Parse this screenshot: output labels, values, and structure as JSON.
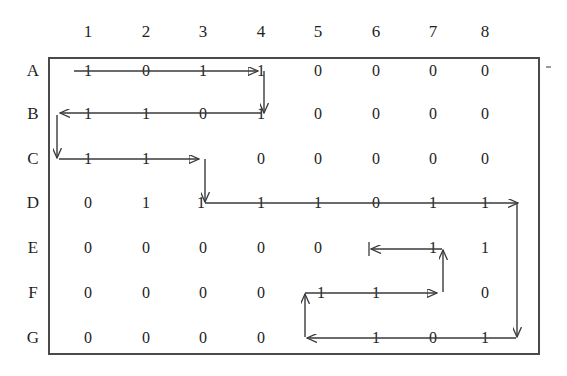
{
  "figure": {
    "kind": "matrix-diagram",
    "ink_color": "#3a3a3a",
    "text_color": "#232323",
    "background_color": "#ffffff",
    "border_color": "#4a4a4a"
  },
  "matrix": {
    "column_headers": [
      "1",
      "2",
      "3",
      "4",
      "5",
      "6",
      "7",
      "8"
    ],
    "row_headers": [
      "A",
      "B",
      "C",
      "D",
      "E",
      "F",
      "G"
    ],
    "rows": [
      {
        "label": "A",
        "values": [
          "1",
          "0",
          "1",
          "1",
          "0",
          "0",
          "0",
          "0"
        ]
      },
      {
        "label": "B",
        "values": [
          "1",
          "1",
          "0",
          "1",
          "0",
          "0",
          "0",
          "0"
        ]
      },
      {
        "label": "C",
        "values": [
          "1",
          "1",
          "1",
          "0",
          "0",
          "0",
          "0",
          "0"
        ]
      },
      {
        "label": "D",
        "values": [
          "0",
          "1",
          "1",
          "1",
          "1",
          "0",
          "1",
          "1"
        ]
      },
      {
        "label": "E",
        "values": [
          "0",
          "0",
          "0",
          "0",
          "0",
          "1",
          "1",
          "1"
        ]
      },
      {
        "label": "F",
        "values": [
          "0",
          "0",
          "0",
          "0",
          "1",
          "1",
          "1",
          "0"
        ]
      },
      {
        "label": "G",
        "values": [
          "0",
          "0",
          "0",
          "0",
          "1",
          "1",
          "0",
          "1"
        ]
      }
    ]
  },
  "path": {
    "description": "Arrowed traversal threading the cells containing 1",
    "segments": [
      {
        "name": "A1-to-A4",
        "row": "A",
        "from_col": 1,
        "to_col": 4,
        "direction": "right"
      },
      {
        "name": "A4-down-to-B4",
        "from": "A4",
        "to": "B4",
        "direction": "down"
      },
      {
        "name": "B4-to-B1",
        "row": "B",
        "from_col": 4,
        "to_col": 1,
        "direction": "left"
      },
      {
        "name": "B1-down-to-C1",
        "from": "B1",
        "to": "C1",
        "direction": "down"
      },
      {
        "name": "C1-to-C3",
        "row": "C",
        "from_col": 1,
        "to_col": 3,
        "direction": "right"
      },
      {
        "name": "C3-down-to-D3",
        "from": "C3",
        "to": "D3",
        "direction": "down"
      },
      {
        "name": "D3-to-D8",
        "row": "D",
        "from_col": 3,
        "to_col": 8,
        "direction": "right"
      },
      {
        "name": "D8-down-to-G8",
        "from": "D8",
        "to": "G8",
        "direction": "down"
      },
      {
        "name": "G8-to-G5",
        "row": "G",
        "from_col": 8,
        "to_col": 5,
        "direction": "left"
      },
      {
        "name": "G5-up-to-F5",
        "from": "G5",
        "to": "F5",
        "direction": "up"
      },
      {
        "name": "F5-to-F7",
        "row": "F",
        "from_col": 5,
        "to_col": 7,
        "direction": "right"
      },
      {
        "name": "F7-up-to-E7",
        "from": "F7",
        "to": "E7",
        "direction": "up"
      },
      {
        "name": "E7-to-E6",
        "row": "E",
        "from_col": 7,
        "to_col": 6,
        "direction": "left"
      }
    ]
  }
}
